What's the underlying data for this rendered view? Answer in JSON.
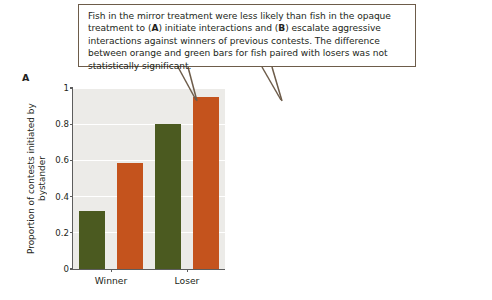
{
  "callout": {
    "text_segments": [
      {
        "t": "Fish in the mirror treatment were less likely than fish in the opaque treatment to (",
        "b": false
      },
      {
        "t": "A",
        "b": true
      },
      {
        "t": ") initiate interactions and (",
        "b": false
      },
      {
        "t": "B",
        "b": true
      },
      {
        "t": ") escalate aggressive interactions against winners of previous contests. The difference between orange and green bars for fish paired with losers was not statistically significant.",
        "b": false
      }
    ],
    "full_text": "Fish in the mirror treatment were less likely than fish in the opaque treatment to (A) initiate interactions and (B) escalate aggressive interactions against winners of previous contests. The difference between orange and green bars for fish paired with losers was not statistically significant."
  },
  "colors": {
    "mirror_green": "#4b5a20",
    "opaque_orange": "#c4531d",
    "plot_background": "#ecebe8",
    "gridline": "#ffffff",
    "axis": "#5d5d5d",
    "callout_border": "#6d5c4a",
    "text": "#231f20"
  },
  "legend": {
    "position": "panel-b-top-left",
    "entries": [
      {
        "label": "Mirror treatment",
        "color": "#4b5a20"
      },
      {
        "label": "Opaque treatment",
        "color": "#c4531d"
      }
    ]
  },
  "panels": {
    "a": {
      "letter": "A"
    },
    "b": {
      "letter": "B"
    }
  },
  "chart_data": [
    {
      "type": "bar",
      "panel": "A",
      "title": "",
      "xlabel": "",
      "ylabel": "Proportion of contests initiated by bystander",
      "ylabel_lines": [
        "Proportion of contests initiated",
        "by bystander"
      ],
      "categories": [
        "Winner",
        "Loser"
      ],
      "series": [
        {
          "name": "Mirror treatment",
          "color": "#4b5a20",
          "values": [
            0.32,
            0.8
          ]
        },
        {
          "name": "Opaque treatment",
          "color": "#c4531d",
          "values": [
            0.585,
            0.95
          ]
        }
      ],
      "ylim": [
        0,
        1
      ],
      "yticks": [
        0,
        0.2,
        0.4,
        0.6,
        0.8,
        1
      ],
      "ytick_labels": [
        "0",
        "0.2",
        "0.4",
        "0.6",
        "0.8",
        "1"
      ],
      "grid": true,
      "legend": false
    },
    {
      "type": "bar",
      "panel": "B",
      "title": "",
      "xlabel": "",
      "ylabel": "Proportion of escalated contests",
      "ylabel_lines": [
        "Proportion of escalated contests"
      ],
      "categories": [
        "Winner",
        "Loser"
      ],
      "series": [
        {
          "name": "Mirror treatment",
          "color": "#4b5a20",
          "values": [
            0.41,
            0.115
          ]
        },
        {
          "name": "Opaque treatment",
          "color": "#c4531d",
          "values": [
            0.705,
            0.2
          ]
        }
      ],
      "ylim": [
        0,
        1
      ],
      "yticks": [
        0,
        0.2,
        0.4,
        0.6,
        0.8,
        1
      ],
      "ytick_labels": [
        "0",
        "0.2",
        "0.4",
        "0.6",
        "0.8",
        "1"
      ],
      "grid": true,
      "legend": true
    }
  ]
}
